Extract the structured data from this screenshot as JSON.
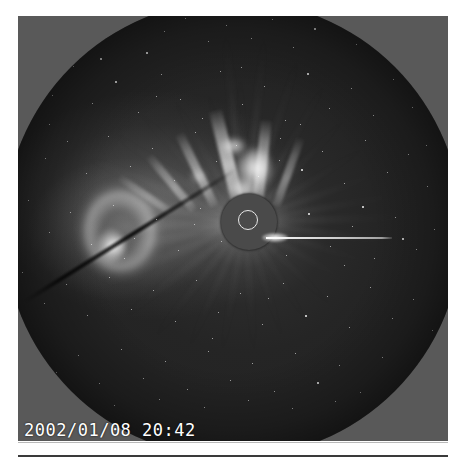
{
  "frame": {
    "timestamp": "2002/01/08 20:42",
    "instrument_caption": "",
    "colors": {
      "outside_fov_gray": "#595959",
      "sky_dark": "#242424",
      "occulter_gray": "#4a4a4a",
      "sun_circle_outline": "#e8e8e8",
      "pylon_white": "#ffffff",
      "timestamp_text": "#ffffff",
      "page_background": "#ffffff",
      "plate_bottom_rule": "#b9b9b9",
      "footer_rule": "#3a3a3a"
    },
    "features": {
      "occulter_label": "occulting-disk",
      "sun_circle_label": "sun-limb-circle",
      "pylon_label": "occulter-support-pylon",
      "cme_label": "coronal-mass-ejection-loop",
      "streamer_label": "coronal-streamers",
      "dark_streak_label": "diagonal-detector-artifact",
      "starfield_label": "background-starfield"
    }
  },
  "stars": [
    [
      38,
      30,
      1
    ],
    [
      57,
      22,
      1
    ],
    [
      72,
      44,
      1
    ],
    [
      91,
      36,
      1
    ],
    [
      118,
      20,
      1
    ],
    [
      142,
      52,
      2
    ],
    [
      160,
      31,
      1
    ],
    [
      181,
      18,
      1
    ],
    [
      204,
      41,
      1
    ],
    [
      222,
      25,
      1
    ],
    [
      247,
      38,
      1
    ],
    [
      268,
      19,
      1
    ],
    [
      289,
      47,
      1
    ],
    [
      310,
      28,
      2
    ],
    [
      333,
      15,
      1
    ],
    [
      352,
      44,
      1
    ],
    [
      374,
      26,
      1
    ],
    [
      392,
      55,
      1
    ],
    [
      409,
      33,
      1
    ],
    [
      424,
      62,
      1
    ],
    [
      26,
      78,
      1
    ],
    [
      48,
      95,
      1
    ],
    [
      69,
      66,
      1
    ],
    [
      88,
      103,
      1
    ],
    [
      111,
      81,
      2
    ],
    [
      134,
      112,
      1
    ],
    [
      157,
      74,
      1
    ],
    [
      176,
      99,
      1
    ],
    [
      198,
      118,
      1
    ],
    [
      216,
      71,
      1
    ],
    [
      238,
      104,
      1
    ],
    [
      260,
      86,
      1
    ],
    [
      281,
      120,
      1
    ],
    [
      303,
      73,
      2
    ],
    [
      325,
      108,
      1
    ],
    [
      347,
      88,
      1
    ],
    [
      369,
      115,
      1
    ],
    [
      389,
      79,
      1
    ],
    [
      408,
      107,
      1
    ],
    [
      427,
      91,
      1
    ],
    [
      20,
      130,
      1
    ],
    [
      41,
      158,
      1
    ],
    [
      63,
      141,
      1
    ],
    [
      82,
      173,
      1
    ],
    [
      104,
      136,
      1
    ],
    [
      126,
      166,
      1
    ],
    [
      148,
      148,
      1
    ],
    [
      170,
      180,
      1
    ],
    [
      191,
      132,
      1
    ],
    [
      212,
      161,
      1
    ],
    [
      232,
      145,
      1
    ],
    [
      254,
      176,
      1
    ],
    [
      276,
      138,
      1
    ],
    [
      297,
      169,
      2
    ],
    [
      318,
      151,
      1
    ],
    [
      340,
      183,
      1
    ],
    [
      361,
      140,
      1
    ],
    [
      383,
      172,
      1
    ],
    [
      404,
      154,
      1
    ],
    [
      423,
      186,
      1
    ],
    [
      24,
      200,
      1
    ],
    [
      45,
      232,
      1
    ],
    [
      66,
      212,
      1
    ],
    [
      87,
      244,
      1
    ],
    [
      109,
      205,
      1
    ],
    [
      130,
      238,
      1
    ],
    [
      152,
      219,
      1
    ],
    [
      174,
      250,
      1
    ],
    [
      196,
      208,
      1
    ],
    [
      217,
      241,
      1
    ],
    [
      260,
      224,
      1
    ],
    [
      282,
      255,
      1
    ],
    [
      304,
      213,
      2
    ],
    [
      326,
      246,
      1
    ],
    [
      348,
      226,
      1
    ],
    [
      370,
      258,
      1
    ],
    [
      391,
      217,
      1
    ],
    [
      412,
      249,
      1
    ],
    [
      430,
      229,
      1
    ],
    [
      18,
      272,
      1
    ],
    [
      40,
      303,
      1
    ],
    [
      62,
      284,
      1
    ],
    [
      83,
      315,
      1
    ],
    [
      105,
      277,
      1
    ],
    [
      127,
      309,
      1
    ],
    [
      149,
      290,
      1
    ],
    [
      171,
      321,
      1
    ],
    [
      192,
      280,
      1
    ],
    [
      214,
      312,
      1
    ],
    [
      236,
      293,
      1
    ],
    [
      258,
      324,
      1
    ],
    [
      279,
      283,
      1
    ],
    [
      301,
      315,
      2
    ],
    [
      323,
      296,
      1
    ],
    [
      345,
      327,
      1
    ],
    [
      366,
      287,
      1
    ],
    [
      388,
      318,
      1
    ],
    [
      409,
      299,
      1
    ],
    [
      428,
      330,
      1
    ],
    [
      30,
      344,
      1
    ],
    [
      52,
      372,
      1
    ],
    [
      74,
      355,
      1
    ],
    [
      95,
      383,
      1
    ],
    [
      117,
      349,
      1
    ],
    [
      139,
      378,
      1
    ],
    [
      161,
      361,
      1
    ],
    [
      183,
      389,
      1
    ],
    [
      204,
      351,
      1
    ],
    [
      226,
      380,
      1
    ],
    [
      248,
      363,
      1
    ],
    [
      270,
      391,
      1
    ],
    [
      291,
      353,
      1
    ],
    [
      313,
      382,
      2
    ],
    [
      335,
      365,
      1
    ],
    [
      356,
      392,
      1
    ],
    [
      378,
      357,
      1
    ],
    [
      398,
      385,
      1
    ],
    [
      416,
      368,
      1
    ],
    [
      66,
      398,
      1
    ],
    [
      110,
      405,
      1
    ],
    [
      155,
      399,
      1
    ],
    [
      200,
      407,
      1
    ],
    [
      244,
      400,
      1
    ],
    [
      288,
      408,
      1
    ],
    [
      331,
      401,
      1
    ],
    [
      374,
      409,
      1
    ],
    [
      405,
      397,
      1
    ],
    [
      96,
      58,
      2
    ],
    [
      152,
      96,
      1
    ],
    [
      237,
      67,
      1
    ],
    [
      296,
      124,
      1
    ],
    [
      358,
      206,
      2
    ],
    [
      120,
      258,
      1
    ],
    [
      190,
      224,
      1
    ],
    [
      275,
      160,
      1
    ],
    [
      340,
      265,
      1
    ],
    [
      208,
      338,
      1
    ],
    [
      264,
      298,
      1
    ],
    [
      398,
      238,
      2
    ],
    [
      45,
      124,
      1
    ],
    [
      422,
      145,
      1
    ]
  ],
  "rays": [
    {
      "angle": -96,
      "length": 190,
      "opacity": 0.55,
      "thickness": 7
    },
    {
      "angle": -84,
      "length": 186,
      "opacity": 0.5,
      "thickness": 6
    },
    {
      "angle": -72,
      "length": 176,
      "opacity": 0.42,
      "thickness": 6
    },
    {
      "angle": -60,
      "length": 164,
      "opacity": 0.35,
      "thickness": 5
    },
    {
      "angle": -46,
      "length": 150,
      "opacity": 0.28,
      "thickness": 5
    },
    {
      "angle": -32,
      "length": 146,
      "opacity": 0.26,
      "thickness": 5
    },
    {
      "angle": -20,
      "length": 152,
      "opacity": 0.3,
      "thickness": 6
    },
    {
      "angle": -10,
      "length": 160,
      "opacity": 0.32,
      "thickness": 6
    },
    {
      "angle": -2,
      "length": 170,
      "opacity": 0.34,
      "thickness": 7
    },
    {
      "angle": 8,
      "length": 160,
      "opacity": 0.3,
      "thickness": 6
    },
    {
      "angle": 18,
      "length": 148,
      "opacity": 0.24,
      "thickness": 5
    },
    {
      "angle": 30,
      "length": 136,
      "opacity": 0.2,
      "thickness": 5
    },
    {
      "angle": 44,
      "length": 130,
      "opacity": 0.18,
      "thickness": 5
    },
    {
      "angle": 58,
      "length": 128,
      "opacity": 0.17,
      "thickness": 5
    },
    {
      "angle": 72,
      "length": 132,
      "opacity": 0.18,
      "thickness": 5
    },
    {
      "angle": 86,
      "length": 138,
      "opacity": 0.2,
      "thickness": 6
    },
    {
      "angle": 100,
      "length": 140,
      "opacity": 0.21,
      "thickness": 6
    },
    {
      "angle": 114,
      "length": 146,
      "opacity": 0.24,
      "thickness": 6
    },
    {
      "angle": 128,
      "length": 152,
      "opacity": 0.26,
      "thickness": 6
    },
    {
      "angle": 142,
      "length": 160,
      "opacity": 0.3,
      "thickness": 7
    },
    {
      "angle": 156,
      "length": 172,
      "opacity": 0.36,
      "thickness": 8
    },
    {
      "angle": 168,
      "length": 180,
      "opacity": 0.42,
      "thickness": 9
    },
    {
      "angle": 178,
      "length": 185,
      "opacity": 0.46,
      "thickness": 9
    },
    {
      "angle": 190,
      "length": 182,
      "opacity": 0.44,
      "thickness": 9
    },
    {
      "angle": 202,
      "length": 174,
      "opacity": 0.38,
      "thickness": 8
    },
    {
      "angle": 214,
      "length": 166,
      "opacity": 0.32,
      "thickness": 7
    },
    {
      "angle": 226,
      "length": 158,
      "opacity": 0.28,
      "thickness": 6
    },
    {
      "angle": 240,
      "length": 150,
      "opacity": 0.24,
      "thickness": 6
    },
    {
      "angle": 254,
      "length": 144,
      "opacity": 0.22,
      "thickness": 5
    },
    {
      "angle": 268,
      "length": 150,
      "opacity": 0.26,
      "thickness": 6
    }
  ],
  "blades": [
    {
      "left": 228,
      "top": 108,
      "w": 13,
      "h": 96,
      "rot": -14,
      "op": 0.8
    },
    {
      "left": 248,
      "top": 120,
      "w": 11,
      "h": 84,
      "rot": 6,
      "op": 0.72
    },
    {
      "left": 206,
      "top": 126,
      "w": 9,
      "h": 80,
      "rot": -26,
      "op": 0.6
    },
    {
      "left": 186,
      "top": 140,
      "w": 8,
      "h": 70,
      "rot": -40,
      "op": 0.5
    },
    {
      "left": 268,
      "top": 134,
      "w": 8,
      "h": 72,
      "rot": 20,
      "op": 0.45
    },
    {
      "left": 163,
      "top": 150,
      "w": 7,
      "h": 62,
      "rot": -56,
      "op": 0.4
    }
  ],
  "bright_knots": [
    {
      "left": 234,
      "top": 148,
      "w": 34,
      "h": 40,
      "op": 0.92
    },
    {
      "left": 216,
      "top": 138,
      "w": 26,
      "h": 16,
      "op": 0.8
    },
    {
      "left": 226,
      "top": 178,
      "w": 28,
      "h": 22,
      "op": 0.7
    },
    {
      "left": 186,
      "top": 170,
      "w": 16,
      "h": 14,
      "op": 0.42
    },
    {
      "left": 104,
      "top": 236,
      "w": 18,
      "h": 20,
      "op": 0.75
    }
  ]
}
